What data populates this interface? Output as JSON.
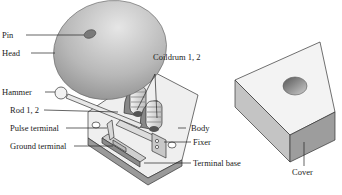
{
  "figure": {
    "type": "labeled-exploded-diagram",
    "labels": {
      "pin": "Pin",
      "head": "Head",
      "hammer": "Hammer",
      "rod": "Rod 1, 2",
      "pulse_terminal": "Pulse terminal",
      "ground_terminal": "Ground terminal",
      "coildrum": "Coildrum 1, 2",
      "body": "Body",
      "fixer": "Fixer",
      "terminal_base": "Terminal base",
      "cover": "Cover"
    }
  }
}
